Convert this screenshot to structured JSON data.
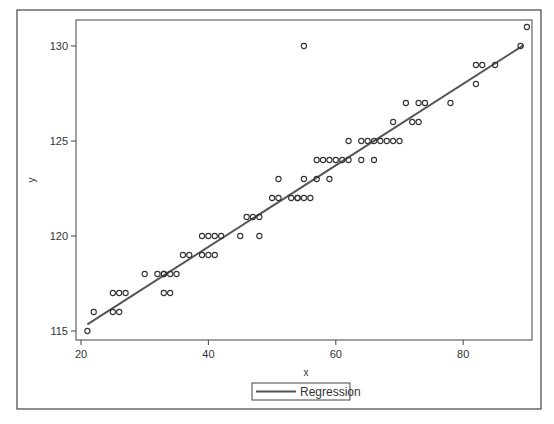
{
  "chart_data": {
    "type": "scatter",
    "title": "",
    "xlabel": "x",
    "ylabel": "y",
    "xlim": [
      19,
      91
    ],
    "ylim": [
      114.5,
      131.4
    ],
    "x_ticks": [
      20,
      40,
      60,
      80
    ],
    "y_ticks": [
      115,
      120,
      125,
      130
    ],
    "x_tick_labels": [
      "20",
      "40",
      "60",
      "80"
    ],
    "y_tick_labels": [
      "115",
      "120",
      "125",
      "130"
    ],
    "grid": false,
    "legend_position": "bottom-center",
    "series": [
      {
        "name": "Observations",
        "type": "scatter",
        "marker": "open-circle",
        "color": "#333333",
        "points": [
          [
            21,
            115
          ],
          [
            22,
            116
          ],
          [
            25,
            116
          ],
          [
            26,
            116
          ],
          [
            25,
            117
          ],
          [
            26,
            117
          ],
          [
            27,
            117
          ],
          [
            30,
            118
          ],
          [
            32,
            118
          ],
          [
            33,
            118
          ],
          [
            33,
            118
          ],
          [
            34,
            118
          ],
          [
            35,
            118
          ],
          [
            33,
            117
          ],
          [
            34,
            117
          ],
          [
            36,
            119
          ],
          [
            37,
            119
          ],
          [
            39,
            119
          ],
          [
            40,
            119
          ],
          [
            41,
            119
          ],
          [
            39,
            120
          ],
          [
            40,
            120
          ],
          [
            41,
            120
          ],
          [
            42,
            120
          ],
          [
            45,
            120
          ],
          [
            48,
            120
          ],
          [
            46,
            121
          ],
          [
            47,
            121
          ],
          [
            48,
            121
          ],
          [
            50,
            122
          ],
          [
            51,
            122
          ],
          [
            53,
            122
          ],
          [
            54,
            122
          ],
          [
            54,
            122
          ],
          [
            55,
            122
          ],
          [
            56,
            122
          ],
          [
            51,
            123
          ],
          [
            55,
            123
          ],
          [
            57,
            123
          ],
          [
            59,
            123
          ],
          [
            57,
            124
          ],
          [
            58,
            124
          ],
          [
            59,
            124
          ],
          [
            60,
            124
          ],
          [
            61,
            124
          ],
          [
            62,
            124
          ],
          [
            64,
            124
          ],
          [
            66,
            124
          ],
          [
            62,
            125
          ],
          [
            64,
            125
          ],
          [
            65,
            125
          ],
          [
            66,
            125
          ],
          [
            67,
            125
          ],
          [
            68,
            125
          ],
          [
            69,
            125
          ],
          [
            70,
            125
          ],
          [
            69,
            126
          ],
          [
            72,
            126
          ],
          [
            73,
            126
          ],
          [
            71,
            127
          ],
          [
            73,
            127
          ],
          [
            74,
            127
          ],
          [
            78,
            127
          ],
          [
            82,
            128
          ],
          [
            82,
            129
          ],
          [
            83,
            129
          ],
          [
            85,
            129
          ],
          [
            89,
            130
          ],
          [
            55,
            130
          ],
          [
            90,
            131
          ]
        ]
      },
      {
        "name": "Regression",
        "type": "line",
        "color": "#555555",
        "x": [
          21,
          89.5
        ],
        "y": [
          115.35,
          130.05
        ]
      }
    ]
  },
  "legend": {
    "items": [
      {
        "label": "Regression",
        "symbol": "line"
      }
    ]
  },
  "axes": {
    "x_label": "x",
    "y_label": "y"
  }
}
